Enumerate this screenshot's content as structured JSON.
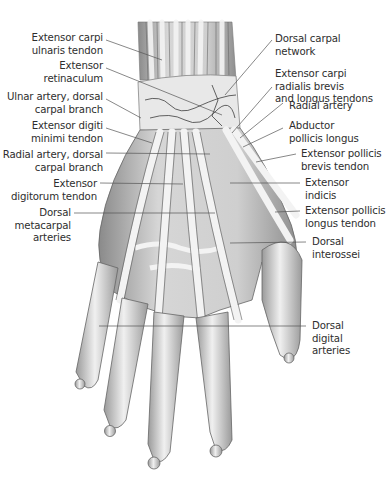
{
  "figure": {
    "colors": {
      "label_text": "#2e2e2e",
      "leader_line": "#555555",
      "tissue_fill": "#dcdcdc",
      "tendon_fill": "#f2f2f2",
      "shadow": "#6e6e6e",
      "vessel": "#3c3c3c"
    }
  },
  "labels": {
    "left": [
      {
        "id": "ecu",
        "text": "Extensor carpi\nulnaris tendon"
      },
      {
        "id": "retinaculum",
        "text": "Extensor\nretinaculum"
      },
      {
        "id": "ulnar-artery",
        "text": "Ulnar artery, dorsal\ncarpal branch"
      },
      {
        "id": "edm",
        "text": "Extensor digiti\nminimi tendon"
      },
      {
        "id": "radial-artery-branch",
        "text": "Radial artery, dorsal\ncarpal branch"
      },
      {
        "id": "ed",
        "text": "Extensor\ndigitorum tendon"
      },
      {
        "id": "metacarpal-arteries",
        "text": "Dorsal\nmetacarpal\narteries"
      }
    ],
    "right": [
      {
        "id": "carpal-network",
        "text": "Dorsal carpal\nnetwork"
      },
      {
        "id": "ecrb-ecrl",
        "text": "Extensor carpi\nradialis brevis\nand longus tendons"
      },
      {
        "id": "radial-artery",
        "text": "Radial artery"
      },
      {
        "id": "apl",
        "text": "Abductor\npollicis longus"
      },
      {
        "id": "epb",
        "text": "Extensor pollicis\nbrevis tendon"
      },
      {
        "id": "ei",
        "text": "Extensor\nindicis"
      },
      {
        "id": "epl",
        "text": "Extensor pollicis\nlongus tendon"
      },
      {
        "id": "interossei",
        "text": "Dorsal\ninterossei"
      },
      {
        "id": "digital-arteries",
        "text": "Dorsal\ndigital\narteries"
      }
    ]
  }
}
